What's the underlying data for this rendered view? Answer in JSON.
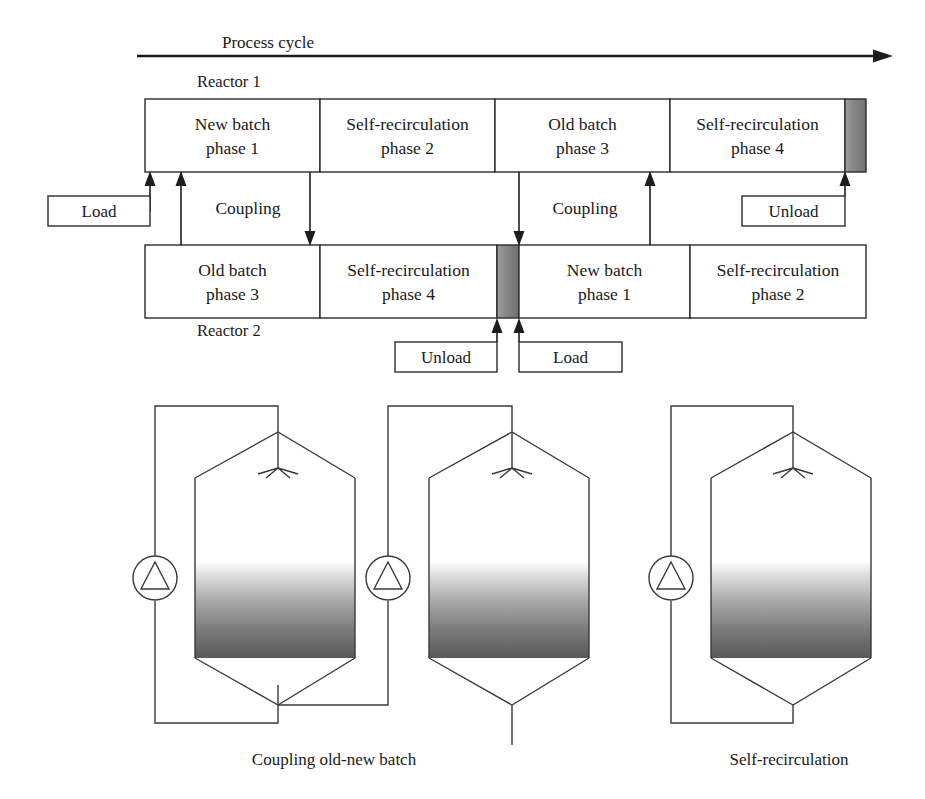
{
  "figure": {
    "title": "Process cycle",
    "reactor1_label": "Reactor 1",
    "reactor2_label": "Reactor 2"
  },
  "timeline": {
    "reactor1_phases": [
      {
        "line1": "New batch",
        "line2": "phase 1"
      },
      {
        "line1": "Self-recirculation",
        "line2": "phase 2"
      },
      {
        "line1": "Old batch",
        "line2": "phase 3"
      },
      {
        "line1": "Self-recirculation",
        "line2": "phase 4"
      }
    ],
    "reactor2_phases": [
      {
        "line1": "Old batch",
        "line2": "phase 3"
      },
      {
        "line1": "Self-recirculation",
        "line2": "phase 4"
      },
      {
        "line1": "New batch",
        "line2": "phase 1"
      },
      {
        "line1": "Self-recirculation",
        "line2": "phase 2"
      }
    ],
    "coupling_label_left": "Coupling",
    "coupling_label_right": "Coupling",
    "load_label_top": "Load",
    "unload_label_top": "Unload",
    "unload_label_bottom": "Unload",
    "load_label_bottom": "Load"
  },
  "schematic": {
    "caption_left": "Coupling old-new batch",
    "caption_right": "Self-recirculation"
  },
  "colors": {
    "line": "#2b2b2b",
    "text": "#1a1a1a",
    "liquid_top": "#f2f2f2",
    "liquid_bottom": "#565656",
    "background": "#ffffff"
  }
}
